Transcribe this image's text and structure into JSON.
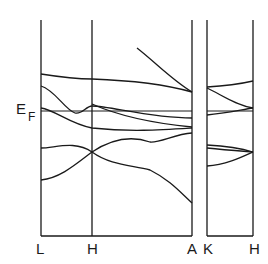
{
  "diagram": {
    "type": "electronic band structure",
    "fermi_label": {
      "main": "E",
      "sub": "F"
    },
    "k_points": [
      {
        "label": "L",
        "x": 41
      },
      {
        "label": "H",
        "x": 92
      },
      {
        "label": "A",
        "x": 192
      },
      {
        "label": "K",
        "x": 207
      },
      {
        "label": "H",
        "x": 253
      }
    ],
    "colors": {
      "line": "#1a1a1a",
      "background": "#ffffff"
    }
  }
}
